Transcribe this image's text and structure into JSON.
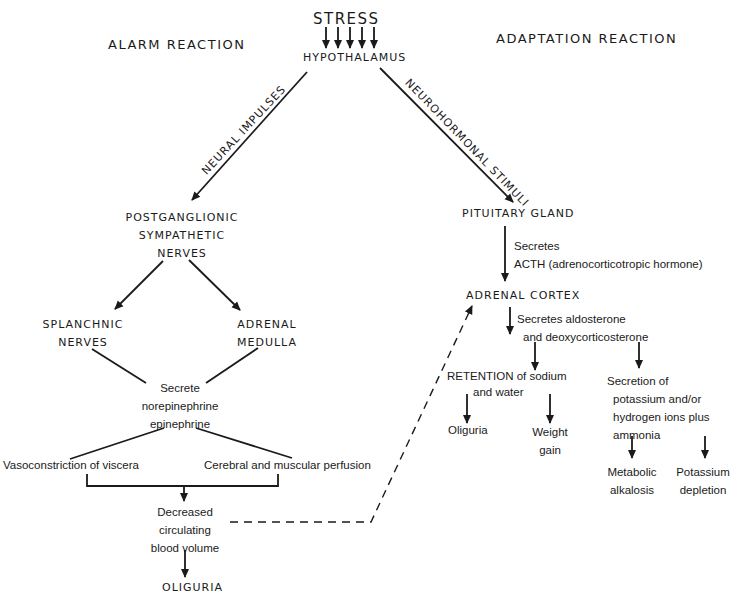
{
  "title": "STRESS",
  "origin": "HYPOTHALAMUS",
  "columns": {
    "left": "ALARM REACTION",
    "right": "ADAPTATION REACTION"
  },
  "pathways": {
    "left": "NEURAL IMPULSES",
    "right": "NEUROHORMONAL STIMULI"
  },
  "alarm": {
    "nerves": [
      "POSTGANGLIONIC",
      "SYMPATHETIC",
      "NERVES"
    ],
    "splanchnic": [
      "SPLANCHNIC",
      "NERVES"
    ],
    "medulla": [
      "ADRENAL",
      "MEDULLA"
    ],
    "secrete": [
      "Secrete",
      "norepinephrine",
      "epinephrine"
    ],
    "vaso": "Vasoconstriction of viscera",
    "perfusion": "Cerebral and muscular perfusion",
    "decreased": [
      "Decreased",
      "circulating",
      "blood volume"
    ],
    "oliguria": "OLIGURIA"
  },
  "adaptation": {
    "pituitary": "PITUITARY GLAND",
    "acth": [
      "Secretes",
      "ACTH (adrenocorticotropic hormone)"
    ],
    "cortex": "ADRENAL CORTEX",
    "aldo": [
      "Secretes aldosterone",
      "and deoxycorticosterone"
    ],
    "retention_1": "RETENTION of sodium",
    "retention_2": "and water",
    "oliguria": "Oliguria",
    "weight": [
      "Weight",
      "gain"
    ],
    "secretion": [
      "Secretion of",
      "potassium and/or",
      "hydrogen ions plus",
      "ammonia"
    ],
    "alkalosis": [
      "Metabolic",
      "alkalosis"
    ],
    "potassium": [
      "Potassium",
      "depletion"
    ]
  },
  "colors": {
    "ink": "#1a1a1a",
    "background": "#ffffff"
  }
}
